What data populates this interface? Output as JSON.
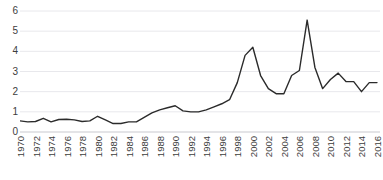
{
  "chart_data": {
    "type": "line",
    "title": "",
    "subtitle": "",
    "xlabel": "",
    "ylabel": "",
    "xlim": [
      1970,
      2016
    ],
    "ylim": [
      0,
      6
    ],
    "grid": true,
    "legend": null,
    "legend_position": "none",
    "line_color": "#2b2b2b",
    "grid_color": "#e8e8ec",
    "text_color": "#3d3d3d",
    "y_ticks": [
      6,
      5,
      4,
      3,
      2,
      1,
      0
    ],
    "y_tick_labels": [
      "6",
      "5",
      "4",
      "3",
      "2",
      "1",
      "0"
    ],
    "x_tick_labels": [
      "1970",
      "1972",
      "1974",
      "1976",
      "1978",
      "1980",
      "1982",
      "1984",
      "1986",
      "1988",
      "1990",
      "1992",
      "1994",
      "1996",
      "1998",
      "2000",
      "2002",
      "2004",
      "2006",
      "2008",
      "2010",
      "2012",
      "2014",
      "2016"
    ],
    "x_tick_values": [
      1970,
      1972,
      1974,
      1976,
      1978,
      1980,
      1982,
      1984,
      1986,
      1988,
      1990,
      1992,
      1994,
      1996,
      1998,
      2000,
      2002,
      2004,
      2006,
      2008,
      2010,
      2012,
      2014,
      2016
    ],
    "x": [
      1970,
      1971,
      1972,
      1973,
      1974,
      1975,
      1976,
      1977,
      1978,
      1979,
      1980,
      1981,
      1982,
      1983,
      1984,
      1985,
      1986,
      1987,
      1988,
      1989,
      1990,
      1991,
      1992,
      1993,
      1994,
      1995,
      1996,
      1997,
      1998,
      1999,
      2000,
      2001,
      2002,
      2003,
      2004,
      2005,
      2006,
      2007,
      2008,
      2009,
      2010,
      2011,
      2012,
      2013,
      2014,
      2015,
      2016
    ],
    "values": [
      0.55,
      0.5,
      0.52,
      0.68,
      0.5,
      0.62,
      0.63,
      0.6,
      0.52,
      0.55,
      0.78,
      0.6,
      0.42,
      0.42,
      0.5,
      0.5,
      0.72,
      0.95,
      1.1,
      1.2,
      1.3,
      1.05,
      1.0,
      1.0,
      1.1,
      1.25,
      1.4,
      1.6,
      2.45,
      3.8,
      4.2,
      2.8,
      2.15,
      1.9,
      1.9,
      2.8,
      3.05,
      5.55,
      3.2,
      2.15,
      2.6,
      2.92,
      2.5,
      2.5,
      2.0,
      2.45,
      2.45
    ],
    "series_name": "",
    "annotations": []
  }
}
